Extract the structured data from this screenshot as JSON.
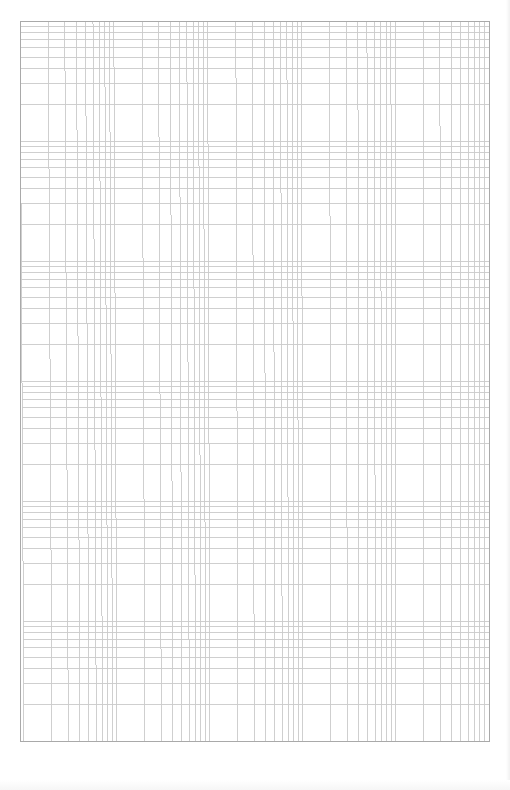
{
  "document": {
    "title": "Log-log graph paper",
    "description": "Blank logarithmic graph paper, 5 cycles horizontal by 6 cycles vertical"
  },
  "grid": {
    "x_cycles": 5,
    "y_cycles": 6,
    "left": 20,
    "top": 21,
    "right": 489,
    "bottom": 741,
    "skew_bottom_left_dx": 4,
    "subdivisions": [
      1,
      2,
      3,
      4,
      5,
      6,
      7,
      8,
      9,
      10
    ],
    "line_color": "#cacaca",
    "border_color": "#a9a9a9",
    "background_color": "#ffffff"
  }
}
